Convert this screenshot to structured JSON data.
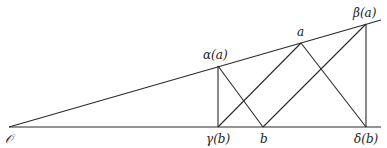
{
  "diagram": {
    "points": {
      "origin": {
        "label": "𝒪",
        "x": 9,
        "y": 127
      },
      "alpha_a": {
        "label": "α(a)",
        "x": 218,
        "y": 66
      },
      "a": {
        "label": "a",
        "x": 301,
        "y": 43
      },
      "beta_a": {
        "label": "β(a)",
        "x": 366,
        "y": 24
      },
      "gamma_b": {
        "label": "γ(b)",
        "x": 218,
        "y": 127
      },
      "b": {
        "label": "b",
        "x": 263,
        "y": 127
      },
      "delta_b": {
        "label": "δ(b)",
        "x": 366,
        "y": 127
      }
    },
    "labels": {
      "origin": "𝒪",
      "alpha_a": "α(a)",
      "a": "a",
      "beta_a": "β(a)",
      "gamma_b": "γ(b)",
      "b": "b",
      "delta_b": "δ(b)"
    },
    "line_color": "#2a2a2a"
  }
}
